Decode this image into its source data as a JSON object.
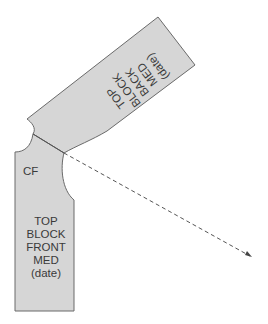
{
  "diagram": {
    "colors": {
      "fill": "#d6d6d6",
      "stroke": "#6a6a6a",
      "text": "#3a3a3a",
      "arrow": "#555555"
    },
    "back_piece": {
      "lines": [
        "TOP",
        "BLOCK",
        "BACK",
        "MED",
        "(date)"
      ]
    },
    "front_piece": {
      "cf_label": "CF",
      "lines": [
        "TOP",
        "BLOCK",
        "FRONT",
        "MED",
        "(date)"
      ]
    },
    "arrow": {
      "style": "dashed"
    }
  }
}
